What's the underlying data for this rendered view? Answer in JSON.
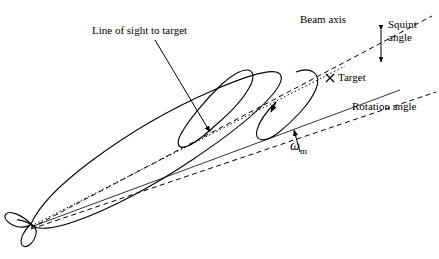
{
  "diagram": {
    "labels": {
      "line_of_sight": "Line of sight to target",
      "beam_axis": "Beam axis",
      "squint_line1": "Squint",
      "squint_line2": "angle",
      "target": "Target",
      "rotation_angle": "Rotation angle",
      "omega": "ω",
      "omega_sub": "m"
    },
    "colors": {
      "stroke": "#000000",
      "background": "#ffffff"
    },
    "elements": {
      "missile_body_outline": "solid ellipse-like body shape",
      "target_marker": "x-marker",
      "rotation_arrow": "circular arrow around beam axis",
      "pointer_arrow": "arrow from line-of-sight label to dotted line"
    }
  }
}
